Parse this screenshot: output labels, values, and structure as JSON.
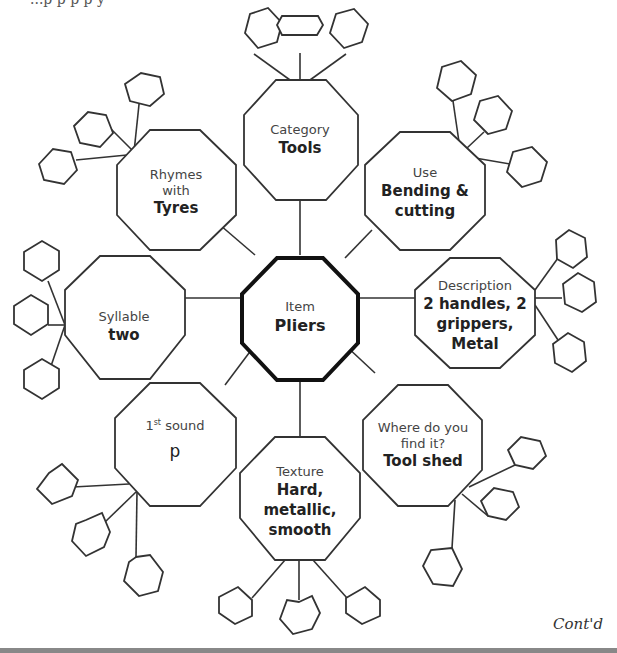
{
  "header": {
    "top_text_cut": "...p   p   p   p   y"
  },
  "center": {
    "label": "Item",
    "value": "Pliers"
  },
  "nodes": [
    {
      "id": "category",
      "label": "Category",
      "value": "Tools"
    },
    {
      "id": "use",
      "label": "Use",
      "value": "Bending & cutting"
    },
    {
      "id": "description",
      "label": "Description",
      "value": "2 handles, 2 grippers, Metal"
    },
    {
      "id": "where",
      "label": "Where do you find it?",
      "value": "Tool shed"
    },
    {
      "id": "texture",
      "label": "Texture",
      "value": "Hard, metallic, smooth"
    },
    {
      "id": "first_sound",
      "label": "1st sound",
      "value": "p"
    },
    {
      "id": "syllable",
      "label": "Syllable",
      "value": "two"
    },
    {
      "id": "rhymes",
      "label": "Rhymes with",
      "value": "Tyres"
    }
  ],
  "footer": {
    "contd": "Cont'd"
  },
  "colors": {
    "stroke": "#333333",
    "center_stroke": "#111111",
    "background": "#ffffff"
  }
}
